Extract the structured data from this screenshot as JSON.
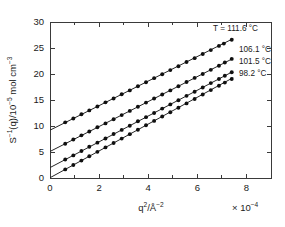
{
  "chart_data": {
    "type": "scatter",
    "title": "",
    "subtitle": "",
    "xlabel": "q2/A-2",
    "xlabel_display": "q²/Å⁻²",
    "ylabel": "S-1(q)/10-5 mol cm-3",
    "ylabel_display": "S⁻¹(q)/10⁻⁵ mol cm⁻³",
    "x_exponent_note": "× 10⁻⁴",
    "xlim": [
      0,
      9
    ],
    "ylim": [
      0,
      30
    ],
    "xticks": [
      0,
      2,
      4,
      6,
      8
    ],
    "xticklabels": [
      "0",
      "2",
      "4",
      "6",
      "8"
    ],
    "xminorticks": [
      1,
      3,
      5,
      7,
      9
    ],
    "yticks": [
      0,
      5,
      10,
      15,
      20,
      25,
      30
    ],
    "yticklabels": [
      "0",
      "5",
      "10",
      "15",
      "20",
      "25",
      "30"
    ],
    "grid": false,
    "legend_position": "inside-right",
    "marker": "filled-circle",
    "series": [
      {
        "name": "T = 111.6 °C",
        "label": "T = 111.6 °C",
        "temperature_C": 111.6,
        "intercept": 9.2,
        "slope": 2.36,
        "x": [
          0.62,
          0.95,
          1.28,
          1.6,
          1.93,
          2.26,
          2.59,
          2.92,
          3.25,
          3.58,
          3.91,
          4.24,
          4.57,
          4.9,
          5.23,
          5.56,
          5.89,
          6.22,
          6.55,
          6.88,
          7.08,
          7.4
        ],
        "y": [
          10.7,
          11.45,
          12.25,
          13.0,
          13.75,
          14.55,
          15.3,
          16.1,
          16.85,
          17.65,
          18.4,
          19.2,
          19.95,
          20.75,
          21.5,
          22.3,
          23.05,
          23.85,
          24.6,
          25.4,
          25.85,
          26.6
        ]
      },
      {
        "name": "106.1 °C",
        "label": "106.1 °C",
        "temperature_C": 106.1,
        "intercept": 5.1,
        "slope": 2.4,
        "x": [
          0.62,
          0.95,
          1.28,
          1.6,
          1.93,
          2.26,
          2.59,
          2.92,
          3.25,
          3.58,
          3.91,
          4.24,
          4.57,
          4.9,
          5.23,
          5.56,
          5.89,
          6.22,
          6.55,
          6.88,
          7.12,
          7.4
        ],
        "y": [
          6.6,
          7.4,
          8.2,
          8.95,
          9.75,
          10.5,
          11.3,
          12.1,
          12.9,
          13.7,
          14.5,
          15.3,
          16.05,
          16.85,
          17.65,
          18.45,
          19.25,
          20.0,
          20.8,
          21.6,
          22.2,
          22.9
        ]
      },
      {
        "name": "101.5 °C",
        "label": "101.5 °C",
        "temperature_C": 101.5,
        "intercept": 2.0,
        "slope": 2.48,
        "x": [
          0.62,
          0.95,
          1.28,
          1.6,
          1.93,
          2.26,
          2.59,
          2.92,
          3.25,
          3.58,
          3.91,
          4.24,
          4.57,
          4.9,
          5.23,
          5.56,
          5.89,
          6.22,
          6.55,
          6.88,
          7.12,
          7.4
        ],
        "y": [
          3.55,
          4.35,
          5.2,
          6.0,
          6.8,
          7.6,
          8.45,
          9.25,
          10.05,
          10.9,
          11.7,
          12.5,
          13.35,
          14.15,
          14.95,
          15.8,
          16.6,
          17.4,
          18.25,
          19.05,
          19.65,
          20.35
        ]
      },
      {
        "name": "98.2 °C",
        "label": "98.2 °C",
        "temperature_C": 98.2,
        "intercept": 0.05,
        "slope": 2.58,
        "x": [
          0.62,
          0.95,
          1.28,
          1.6,
          1.93,
          2.26,
          2.59,
          2.92,
          3.25,
          3.58,
          3.91,
          4.24,
          4.57,
          4.9,
          5.23,
          5.56,
          5.89,
          6.22,
          6.55,
          6.88,
          7.12,
          7.4
        ],
        "y": [
          1.65,
          2.5,
          3.35,
          4.18,
          5.03,
          5.88,
          6.73,
          7.58,
          8.43,
          9.28,
          10.13,
          10.98,
          11.83,
          12.65,
          13.5,
          14.35,
          15.2,
          16.05,
          16.9,
          17.75,
          18.35,
          19.05
        ]
      }
    ]
  },
  "colors": {
    "axis": "#3a3a3a",
    "marker": "#101010",
    "line": "#262626",
    "background": "#ffffff"
  }
}
